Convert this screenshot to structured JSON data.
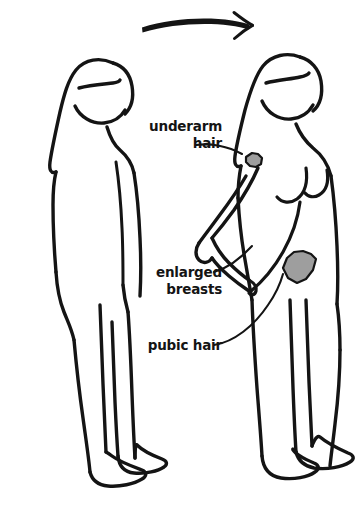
{
  "illustration": {
    "title": "Puberty body changes diagram",
    "background_color": "#ffffff",
    "ink_color": "#141414",
    "hair_patch_color": "#9e9e9e"
  },
  "progression_arrow": {
    "name": "progression-arrow",
    "direction": "left-to-right",
    "description": "curved tapered arrow pointing right"
  },
  "figures": [
    {
      "id": "child-figure",
      "position": "left",
      "stage": "before puberty",
      "description": "flat-chested child body outline in profile facing right"
    },
    {
      "id": "adolescent-figure",
      "position": "right",
      "stage": "after puberty",
      "description": "adolescent body outline with breasts, hand on hip, facing right"
    }
  ],
  "labels": [
    {
      "id": "underarm-hair",
      "line1": "underarm",
      "line2": "hair",
      "anchor_x": 222,
      "anchor_y": 145
    },
    {
      "id": "enlarged-breasts",
      "line1": "enlarged",
      "line2": "breasts",
      "anchor_x": 222,
      "anchor_y": 275
    },
    {
      "id": "pubic-hair",
      "line1": "pubic hair",
      "line2": "",
      "anchor_x": 222,
      "anchor_y": 345
    }
  ],
  "hair_patches": [
    {
      "id": "underarm-hair-patch",
      "location": "armpit"
    },
    {
      "id": "pubic-hair-patch",
      "location": "pubic area"
    }
  ]
}
